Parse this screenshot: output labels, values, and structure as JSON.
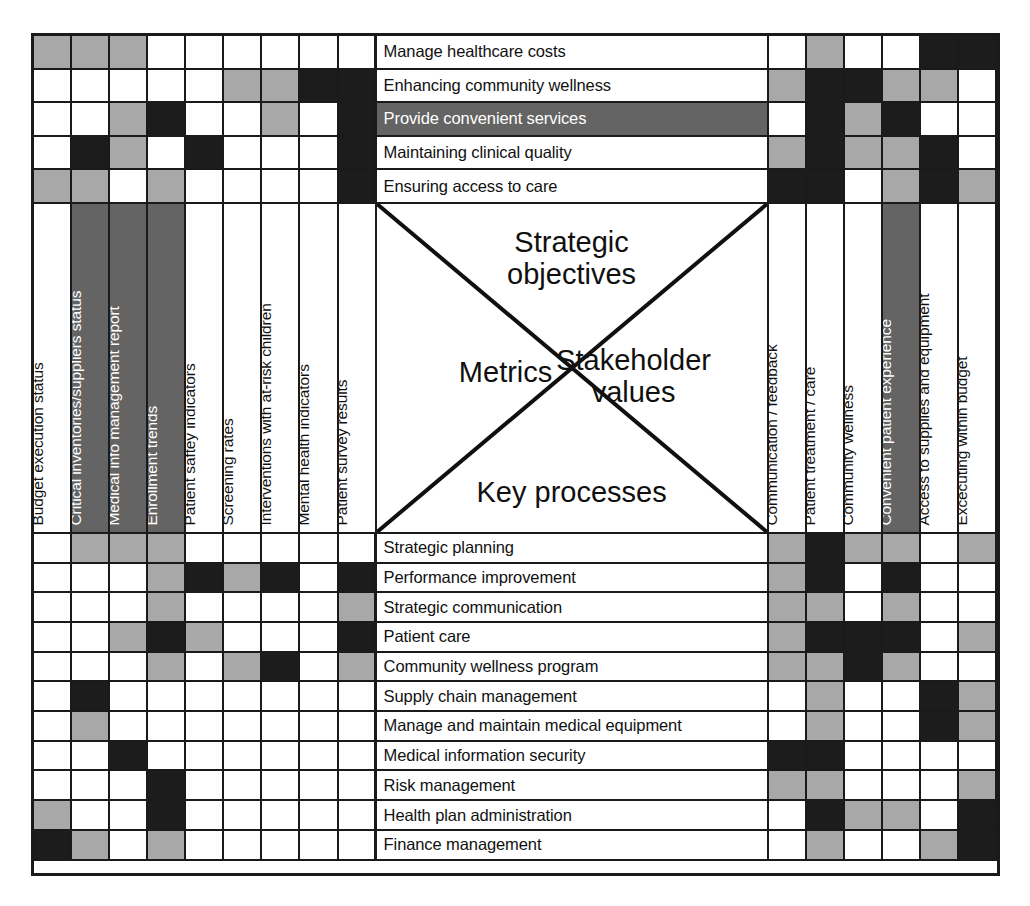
{
  "diagram": {
    "type": "x-matrix",
    "title_quadrants": {
      "top": "Strategic\nobjectives",
      "left": "Metrics",
      "right": "Stakeholder\nvalues",
      "bottom": "Key processes"
    }
  },
  "colors": {
    "strong": "#1c1c1c",
    "weak": "#a8a8a8",
    "none": "#ffffff",
    "highlight_bg": "#646464",
    "highlight_text": "#ffffff",
    "line": "#1a1a1a"
  },
  "legend": {
    "strong_label": "Strong relationship",
    "weak_label": "Weak relationship",
    "none_label": "No relationship"
  },
  "metrics": [
    {
      "label": "Budget execution status",
      "highlighted": false
    },
    {
      "label": "Critical inventories/suppliers status",
      "highlighted": true
    },
    {
      "label": "Medical info management report",
      "highlighted": true
    },
    {
      "label": "Enrollment trends",
      "highlighted": true
    },
    {
      "label": "Patient saftey indicators",
      "highlighted": false
    },
    {
      "label": "Screening rates",
      "highlighted": false
    },
    {
      "label": "Interventions with at-risk children",
      "highlighted": false
    },
    {
      "label": "Mental health indicators",
      "highlighted": false
    },
    {
      "label": "Patient survey results",
      "highlighted": false
    }
  ],
  "stakeholder_values": [
    {
      "label": "Communication / feedback",
      "highlighted": false
    },
    {
      "label": "Patient treatment / care",
      "highlighted": false
    },
    {
      "label": "Community wellness",
      "highlighted": false
    },
    {
      "label": "Convenient patient experience",
      "highlighted": true
    },
    {
      "label": "Access to supplies and equipment",
      "highlighted": false
    },
    {
      "label": "Excecuting within budget",
      "highlighted": false
    }
  ],
  "strategic_objectives": [
    {
      "label": "Manage healthcare costs",
      "highlighted": false
    },
    {
      "label": "Enhancing community wellness",
      "highlighted": false
    },
    {
      "label": "Provide convenient services",
      "highlighted": true
    },
    {
      "label": "Maintaining clinical quality",
      "highlighted": false
    },
    {
      "label": "Ensuring access to care",
      "highlighted": false
    }
  ],
  "key_processes": [
    {
      "label": "Strategic planning"
    },
    {
      "label": "Performance improvement"
    },
    {
      "label": "Strategic communication"
    },
    {
      "label": "Patient care"
    },
    {
      "label": "Community wellness program"
    },
    {
      "label": "Supply chain management"
    },
    {
      "label": "Manage and maintain medical equipment"
    },
    {
      "label": "Medical information security"
    },
    {
      "label": "Risk management"
    },
    {
      "label": "Health plan administration"
    },
    {
      "label": "Finance management"
    }
  ],
  "chart_data": {
    "type": "heatmap",
    "value_map": {
      "w": "none",
      "g": "weak",
      "b": "strong"
    },
    "objectives_vs_metrics": {
      "rows": "strategic_objectives",
      "cols": "metrics",
      "values": [
        [
          "g",
          "g",
          "g",
          "w",
          "w",
          "w",
          "w",
          "w",
          "w"
        ],
        [
          "w",
          "w",
          "w",
          "w",
          "w",
          "g",
          "g",
          "b",
          "b"
        ],
        [
          "w",
          "w",
          "g",
          "b",
          "w",
          "w",
          "g",
          "w",
          "b"
        ],
        [
          "w",
          "b",
          "g",
          "w",
          "b",
          "w",
          "w",
          "w",
          "b"
        ],
        [
          "g",
          "g",
          "w",
          "g",
          "w",
          "w",
          "w",
          "w",
          "b"
        ]
      ]
    },
    "objectives_vs_stakeholder_values": {
      "rows": "strategic_objectives",
      "cols": "stakeholder_values",
      "values": [
        [
          "w",
          "g",
          "w",
          "w",
          "b",
          "b"
        ],
        [
          "g",
          "b",
          "b",
          "g",
          "g",
          "w"
        ],
        [
          "w",
          "b",
          "g",
          "b",
          "w",
          "w"
        ],
        [
          "g",
          "b",
          "g",
          "g",
          "b",
          "w"
        ],
        [
          "b",
          "b",
          "w",
          "g",
          "b",
          "g"
        ]
      ]
    },
    "processes_vs_metrics": {
      "rows": "key_processes",
      "cols": "metrics",
      "values": [
        [
          "w",
          "g",
          "g",
          "g",
          "w",
          "w",
          "w",
          "w",
          "w"
        ],
        [
          "w",
          "w",
          "w",
          "g",
          "b",
          "g",
          "b",
          "w",
          "b"
        ],
        [
          "w",
          "w",
          "w",
          "g",
          "w",
          "w",
          "w",
          "w",
          "g"
        ],
        [
          "w",
          "w",
          "g",
          "b",
          "g",
          "w",
          "w",
          "w",
          "b"
        ],
        [
          "w",
          "w",
          "w",
          "g",
          "w",
          "g",
          "b",
          "w",
          "g"
        ],
        [
          "w",
          "b",
          "w",
          "w",
          "w",
          "w",
          "w",
          "w",
          "w"
        ],
        [
          "w",
          "g",
          "w",
          "w",
          "w",
          "w",
          "w",
          "w",
          "w"
        ],
        [
          "w",
          "w",
          "b",
          "w",
          "w",
          "w",
          "w",
          "w",
          "w"
        ],
        [
          "w",
          "w",
          "w",
          "b",
          "w",
          "w",
          "w",
          "w",
          "w"
        ],
        [
          "g",
          "w",
          "w",
          "b",
          "w",
          "w",
          "w",
          "w",
          "w"
        ],
        [
          "b",
          "g",
          "w",
          "g",
          "w",
          "w",
          "w",
          "w",
          "w"
        ]
      ]
    },
    "processes_vs_stakeholder_values": {
      "rows": "key_processes",
      "cols": "stakeholder_values",
      "values": [
        [
          "g",
          "b",
          "g",
          "g",
          "w",
          "g"
        ],
        [
          "g",
          "b",
          "w",
          "b",
          "w",
          "w"
        ],
        [
          "g",
          "g",
          "w",
          "g",
          "w",
          "w"
        ],
        [
          "g",
          "b",
          "b",
          "b",
          "w",
          "g"
        ],
        [
          "g",
          "g",
          "b",
          "g",
          "w",
          "w"
        ],
        [
          "w",
          "g",
          "w",
          "w",
          "b",
          "g"
        ],
        [
          "w",
          "g",
          "w",
          "w",
          "b",
          "g"
        ],
        [
          "b",
          "b",
          "w",
          "w",
          "w",
          "w"
        ],
        [
          "g",
          "g",
          "w",
          "w",
          "w",
          "g"
        ],
        [
          "w",
          "b",
          "g",
          "g",
          "w",
          "b"
        ],
        [
          "w",
          "g",
          "w",
          "w",
          "g",
          "b"
        ]
      ]
    }
  }
}
